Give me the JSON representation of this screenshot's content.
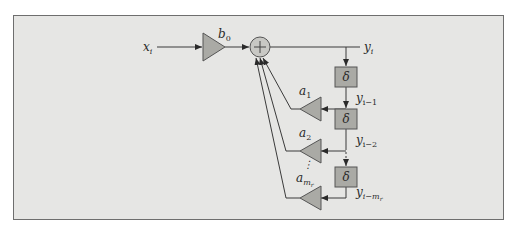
{
  "diagram": {
    "type": "block-diagram",
    "input_label": "x",
    "input_sub": "i",
    "feedforward_gain": {
      "symbol": "b",
      "sub": "0"
    },
    "summing_junction": {
      "glyph": "+"
    },
    "output_label": "y",
    "output_sub": "i",
    "delay_symbol": "δ",
    "delays": [
      {
        "tap_label": "y",
        "tap_sub": "i−1",
        "gain": "a",
        "gain_sub": "1"
      },
      {
        "tap_label": "y",
        "tap_sub": "i−2",
        "gain": "a",
        "gain_sub": "2"
      },
      {
        "tap_label": "y",
        "tap_sub": "i−m",
        "tap_subsub": "r",
        "gain": "a",
        "gain_sub": "m",
        "gain_subsub": "r"
      }
    ],
    "ellipsis": "⋮"
  },
  "colors": {
    "panel_bg": "#e6e6e4",
    "block_fill": "#aaaaa5",
    "junction_fill": "#c8c8c4",
    "line": "#3a3a3a"
  }
}
